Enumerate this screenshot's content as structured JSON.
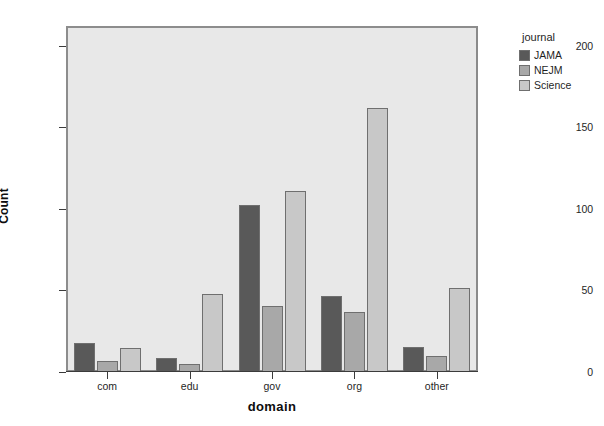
{
  "chart_data": {
    "type": "bar",
    "title": "",
    "subtitle": "",
    "xlabel": "domain",
    "ylabel": "Count",
    "categories": [
      "com",
      "edu",
      "gov",
      "org",
      "other"
    ],
    "series": [
      {
        "name": "JAMA",
        "values": [
          17,
          8,
          102,
          46,
          15
        ],
        "color": "#595959"
      },
      {
        "name": "NEJM",
        "values": [
          6,
          4,
          40,
          36,
          9
        ],
        "color": "#a8a8a8"
      },
      {
        "name": "Science",
        "values": [
          14,
          47,
          110,
          161,
          51
        ],
        "color": "#c8c8c8"
      }
    ],
    "legend": {
      "title": "journal",
      "position": "right",
      "entries": [
        "JAMA",
        "NEJM",
        "Science"
      ]
    },
    "ylim": [
      0,
      212
    ],
    "yticks": [
      0,
      50,
      100,
      150,
      200
    ],
    "ytick_labels": [
      "0",
      "50",
      "100",
      "150",
      "200"
    ],
    "grid": false,
    "plot_background": "#e8e8e8",
    "figure_background": "#ffffff",
    "bar_border_color": "#6f6f6f",
    "axis_color": "#3b3b3b"
  }
}
